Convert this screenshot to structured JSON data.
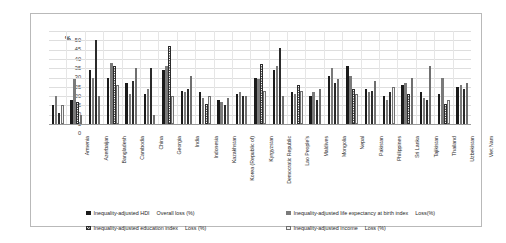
{
  "chart_data": {
    "type": "bar",
    "title": "",
    "xlabel": "",
    "ylabel": "%",
    "ylim": [
      0,
      50
    ],
    "grid": true,
    "legend_position": "bottom",
    "y_ticks": [
      0,
      5,
      10,
      15,
      20,
      25,
      30,
      35,
      40,
      45,
      50
    ],
    "categories": [
      "Armenia",
      "Azerbaijan",
      "Bangladesh",
      "Cambodia",
      "China",
      "Georgia",
      "India",
      "Indonesia",
      "Kazakhstan",
      "Korea (Republic of)",
      "Kyrgyzstan",
      "Democratic Republic",
      "Lao People's",
      "Maldives",
      "Mongolia",
      "Nepal",
      "Pakistan",
      "Philippines",
      "Sri Lanka",
      "Tajikistan",
      "Thailand",
      "Uzbekistan",
      "Viet Nam"
    ],
    "series": [
      {
        "name": "Inequality-adjusted HDI",
        "sublabel": "Overall loss (%)",
        "swatch": "solid-black",
        "values": [
          10,
          13,
          29,
          25,
          22,
          16,
          29,
          18,
          17,
          13,
          16,
          25,
          29,
          17,
          15,
          26,
          31,
          19,
          15,
          21,
          17,
          16,
          20
        ]
      },
      {
        "name": "Inequality-adjusted life expectancy at birth index",
        "sublabel": "Loss(%)",
        "swatch": "solid-gray",
        "values": [
          15,
          24,
          25,
          33,
          16,
          19,
          31,
          17,
          14,
          12,
          17,
          24,
          31,
          16,
          17,
          30,
          26,
          17,
          13,
          22,
          14,
          25,
          21
        ]
      },
      {
        "name": "Inequality-adjusted education index",
        "sublabel": "Loss (%)",
        "swatch": "checkered",
        "values": [
          6,
          12,
          45,
          31,
          23,
          30,
          42,
          19,
          11,
          10,
          15,
          32,
          41,
          21,
          13,
          22,
          19,
          18,
          17,
          16,
          13,
          11,
          19
        ]
      },
      {
        "name": "Inequality-adjusted income",
        "sublabel": "Loss (%)",
        "swatch": "white-outline",
        "values": [
          10,
          5,
          15,
          21,
          30,
          5,
          15,
          26,
          15,
          14,
          15,
          18,
          15,
          18,
          19,
          24,
          16,
          23,
          20,
          25,
          31,
          13,
          22
        ]
      }
    ]
  },
  "legend": {
    "items": [
      {
        "label": "Inequality-adjusted HDI",
        "sub": "Overall loss (%)",
        "swatch": "solid-black"
      },
      {
        "label": "Inequality-adjusted life expectancy at birth index",
        "sub": "Loss(%)",
        "swatch": "solid-gray"
      },
      {
        "label": "Inequality-adjusted education index",
        "sub": "Loss (%)",
        "swatch": "checkered"
      },
      {
        "label": "Inequality-adjusted income",
        "sub": "Loss (%)",
        "swatch": "white-outline"
      }
    ]
  }
}
